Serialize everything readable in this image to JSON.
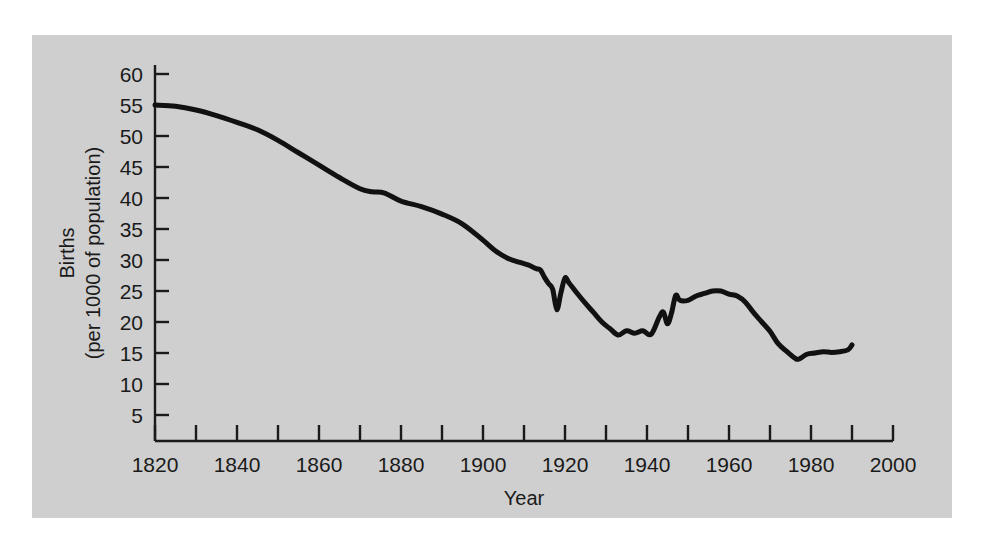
{
  "page": {
    "background_color": "#ffffff",
    "panel_color": "#cfcfcf",
    "bleed_through_text": " "
  },
  "chart_data": {
    "type": "line",
    "title": "",
    "xlabel": "Year",
    "ylabel_line1": "Births",
    "ylabel_line2": "(per 1000 of population)",
    "xlim": [
      1820,
      2000
    ],
    "ylim": [
      0,
      62
    ],
    "xticks": [
      1820,
      1840,
      1860,
      1880,
      1900,
      1920,
      1940,
      1960,
      1980,
      2000
    ],
    "xtick_labels": [
      "1820",
      "1840",
      "1860",
      "1880",
      "1900",
      "1920",
      "1940",
      "1960",
      "1980",
      "2000"
    ],
    "x_minor_tick_step": 10,
    "yticks": [
      5,
      10,
      15,
      20,
      25,
      30,
      35,
      40,
      45,
      50,
      55,
      60
    ],
    "ytick_labels": [
      "5",
      "10",
      "15",
      "20",
      "25",
      "30",
      "35",
      "40",
      "45",
      "50",
      "55",
      "60"
    ],
    "grid": false,
    "legend": null,
    "line_color": "#111111",
    "line_width": 5,
    "series": [
      {
        "name": "Birth rate",
        "x": [
          1820,
          1825,
          1830,
          1835,
          1840,
          1845,
          1850,
          1855,
          1860,
          1865,
          1870,
          1873,
          1876,
          1880,
          1885,
          1890,
          1895,
          1900,
          1903,
          1906,
          1909,
          1911,
          1913,
          1914,
          1915,
          1916,
          1917,
          1918,
          1919,
          1920,
          1921,
          1923,
          1925,
          1927,
          1929,
          1931,
          1933,
          1935,
          1937,
          1939,
          1941,
          1943,
          1944,
          1945,
          1946,
          1947,
          1948,
          1950,
          1952,
          1954,
          1956,
          1958,
          1960,
          1962,
          1964,
          1966,
          1968,
          1970,
          1972,
          1974,
          1976,
          1977,
          1979,
          1981,
          1983,
          1985,
          1987,
          1989,
          1990
        ],
        "y": [
          55.0,
          54.8,
          54.2,
          53.3,
          52.2,
          51.0,
          49.3,
          47.3,
          45.3,
          43.3,
          41.5,
          41.0,
          40.8,
          39.5,
          38.6,
          37.4,
          35.8,
          33.2,
          31.5,
          30.3,
          29.6,
          29.2,
          28.6,
          28.4,
          27.2,
          26.2,
          25.3,
          22.0,
          24.7,
          27.1,
          26.3,
          24.6,
          23.0,
          21.5,
          20.0,
          18.9,
          17.9,
          18.6,
          18.2,
          18.6,
          18.0,
          20.8,
          21.6,
          19.7,
          21.5,
          24.3,
          23.5,
          23.5,
          24.2,
          24.6,
          25.0,
          25.0,
          24.5,
          24.2,
          23.2,
          21.5,
          20.0,
          18.5,
          16.5,
          15.3,
          14.2,
          14.0,
          14.8,
          15.0,
          15.2,
          15.1,
          15.2,
          15.5,
          16.3
        ]
      }
    ]
  }
}
